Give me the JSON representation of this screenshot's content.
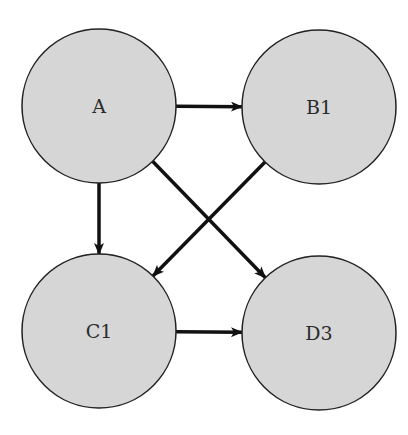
{
  "diagram": {
    "type": "directed-graph",
    "colors": {
      "node_fill": "#d6d6d6",
      "node_stroke": "#222222",
      "edge": "#111111",
      "background": "#ffffff"
    },
    "nodes": [
      {
        "id": "A",
        "label": "A",
        "cx": 99,
        "cy": 106,
        "r": 77
      },
      {
        "id": "B1",
        "label": "B1",
        "cx": 319,
        "cy": 107,
        "r": 77
      },
      {
        "id": "C1",
        "label": "C1",
        "cx": 99,
        "cy": 331,
        "r": 77
      },
      {
        "id": "D3",
        "label": "D3",
        "cx": 319,
        "cy": 333,
        "r": 77
      }
    ],
    "edges": [
      {
        "from": "A",
        "to": "B1"
      },
      {
        "from": "A",
        "to": "C1"
      },
      {
        "from": "A",
        "to": "D3"
      },
      {
        "from": "B1",
        "to": "C1"
      },
      {
        "from": "C1",
        "to": "D3"
      }
    ]
  }
}
